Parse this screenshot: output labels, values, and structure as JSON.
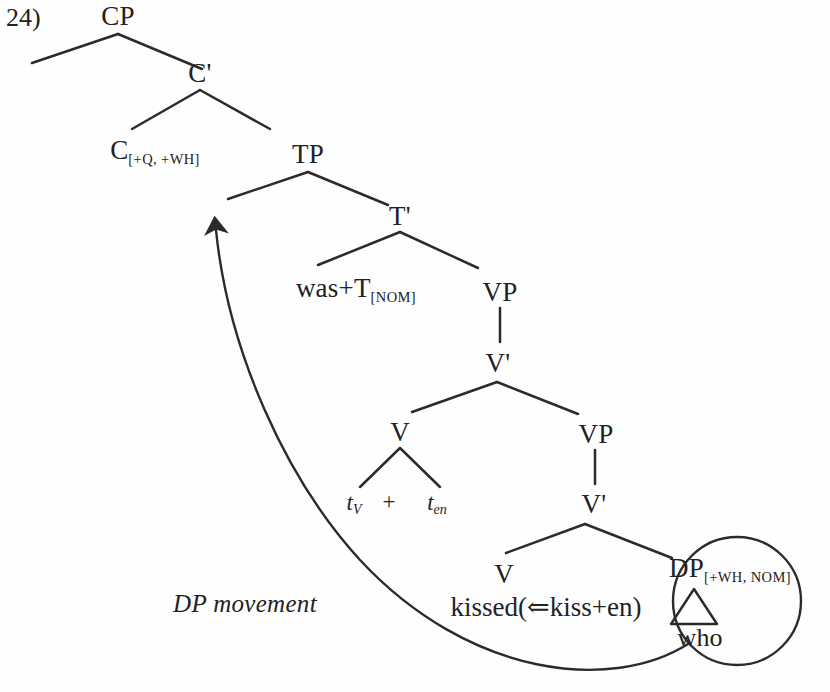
{
  "figure": {
    "item_number": "24)",
    "type": "syntax-tree"
  },
  "nodes": {
    "cp": "CP",
    "c_bar": "C'",
    "c_head": "C",
    "c_head_features": "[+Q, +WH]",
    "tp": "TP",
    "t_bar": "T'",
    "t_head": "was+T",
    "t_head_features": "[NOM]",
    "vp_upper": "VP",
    "v_bar_upper": "V'",
    "v_upper": "V",
    "vp_lower": "VP",
    "v_bar_lower": "V'",
    "v_lower": "V",
    "dp": "DP",
    "dp_features": "[+WH, NOM]"
  },
  "leaves": {
    "trace_v": "t",
    "trace_v_sub": "V",
    "plus": "+",
    "trace_en": "t",
    "trace_en_sub": "en",
    "kissed": "kissed(⇐kiss+en)",
    "who": "who"
  },
  "annotations": {
    "movement_label": "DP movement",
    "arrow_direction": "up-left",
    "circled_constituent": "DP"
  },
  "colors": {
    "background": "#fefefe",
    "ink": "#222222",
    "line": "#2b2b2b"
  }
}
